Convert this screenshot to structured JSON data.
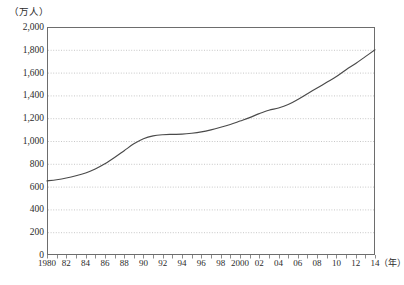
{
  "chart_data": {
    "type": "line",
    "title": "",
    "subtitle": "",
    "unit_caption": "（万人）",
    "xlabel": "（年）",
    "ylabel": "",
    "ylim": [
      0,
      2000
    ],
    "xlim": [
      1980,
      2014
    ],
    "y_tick_step": 200,
    "x_tick_step": 1,
    "x_label_step": 2,
    "grid": "horizontal-dotted",
    "legend": "none",
    "line_color": "#4a4a4a",
    "frame_color": "#6d6d6d",
    "grid_color": "#b9b9b9",
    "background_color": "#ffffff",
    "y_ticks": [
      "0",
      "200",
      "400",
      "600",
      "800",
      "1,000",
      "1,200",
      "1,400",
      "1,600",
      "1,800",
      "2,000"
    ],
    "x_tick_labels": [
      "1980",
      "82",
      "84",
      "86",
      "88",
      "90",
      "92",
      "94",
      "96",
      "98",
      "2000",
      "02",
      "04",
      "06",
      "08",
      "10",
      "12",
      "14"
    ],
    "x": [
      1980,
      1981,
      1982,
      1983,
      1984,
      1985,
      1986,
      1987,
      1988,
      1989,
      1990,
      1991,
      1992,
      1993,
      1994,
      1995,
      1996,
      1997,
      1998,
      1999,
      2000,
      2001,
      2002,
      2003,
      2004,
      2005,
      2006,
      2007,
      2008,
      2009,
      2010,
      2011,
      2012,
      2013,
      2014
    ],
    "series": [
      {
        "name": "",
        "values": [
          650,
          660,
          675,
          695,
          720,
          755,
          800,
          855,
          915,
          975,
          1020,
          1045,
          1055,
          1058,
          1060,
          1068,
          1080,
          1098,
          1120,
          1145,
          1175,
          1205,
          1240,
          1270,
          1290,
          1320,
          1365,
          1415,
          1465,
          1515,
          1565,
          1625,
          1680,
          1740,
          1800
        ]
      }
    ]
  }
}
